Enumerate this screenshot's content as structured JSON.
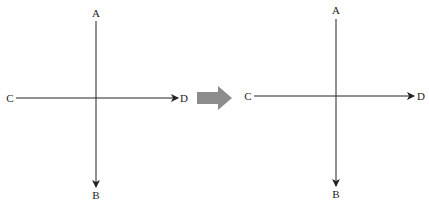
{
  "colors": {
    "line": "#222222",
    "transition_arrow": "#8c8c8c",
    "background": "#ffffff"
  },
  "diagrams": [
    {
      "name": "before",
      "labels": {
        "top": "A",
        "bottom": "B",
        "left": "C",
        "right": "D"
      },
      "vertical_arrow": {
        "from": "A",
        "to": "B",
        "direction": "down"
      },
      "horizontal_arrow": {
        "from": "C",
        "to": "D",
        "direction": "right"
      }
    },
    {
      "name": "after",
      "labels": {
        "top": "A",
        "bottom": "B",
        "left": "C",
        "right": "D"
      },
      "vertical_arrow": {
        "from": "A",
        "to": "B",
        "direction": "down"
      },
      "horizontal_arrow": {
        "from": "C",
        "to": "D",
        "direction": "right"
      }
    }
  ],
  "transition": {
    "icon": "right-arrow-icon",
    "meaning": "transforms into"
  }
}
